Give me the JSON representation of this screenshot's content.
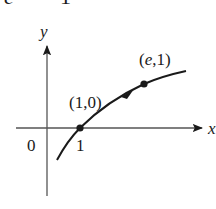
{
  "diagram": {
    "type": "function-graph",
    "top_fragment": {
      "left": "e",
      "right": "1"
    },
    "axes": {
      "x_label": "x",
      "y_label": "y",
      "origin_label": "0",
      "x_tick_label": "1"
    },
    "points": [
      {
        "label": "(1,0)",
        "x": 1,
        "y": 0
      },
      {
        "label": "(e,1)",
        "x": "e",
        "y": 1
      }
    ],
    "colors": {
      "ink": "#1a1a1a",
      "axis": "#555555",
      "background": "#ffffff"
    }
  }
}
